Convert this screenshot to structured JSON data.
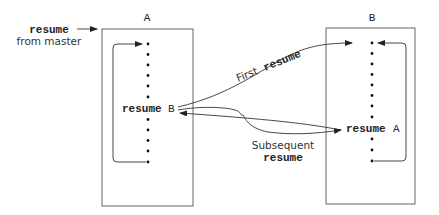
{
  "diagram": {
    "coroutine_a": {
      "label": "A",
      "statement_keyword": "resume",
      "statement_target": "B",
      "dots_above": 6,
      "dots_below": 5
    },
    "coroutine_b": {
      "label": "B",
      "statement_keyword": "resume",
      "statement_target": "A",
      "dots_above": 8,
      "dots_below": 3
    },
    "entry": {
      "keyword": "resume",
      "text": "from master"
    },
    "arrows": {
      "first": {
        "prefix": "First",
        "keyword": "resume"
      },
      "subsequent": {
        "prefix": "Subsequent",
        "keyword": "resume"
      }
    },
    "colors": {
      "line": "#333333",
      "box": "#555555",
      "text": "#222222"
    }
  }
}
